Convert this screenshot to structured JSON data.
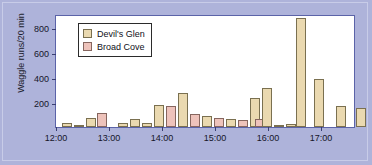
{
  "chart_data": {
    "type": "bar",
    "title": "",
    "xlabel": "",
    "ylabel": "Waggle runs/20 min",
    "ylim": [
      0,
      900
    ],
    "yticks": [
      200,
      400,
      600,
      800
    ],
    "xlim": [
      "12:00",
      "17:20"
    ],
    "xticks": [
      "12:00",
      "13:00",
      "14:00",
      "15:00",
      "16:00",
      "17:00"
    ],
    "grid": false,
    "legend_position": "top-left",
    "bar_width_minutes": 20,
    "series": [
      {
        "name": "Devil's Glen",
        "color": "#ead9b0",
        "points": [
          {
            "time": "12:20",
            "value": 30
          },
          {
            "time": "12:40",
            "value": 15
          },
          {
            "time": "13:00",
            "value": 75
          },
          {
            "time": "13:40",
            "value": 35
          },
          {
            "time": "14:00",
            "value": 60
          },
          {
            "time": "14:20",
            "value": 30
          },
          {
            "time": "14:40",
            "value": 175
          },
          {
            "time": "15:20",
            "value": 270
          },
          {
            "time": "15:40",
            "value": 20
          },
          {
            "time": "16:00",
            "value": 300
          },
          {
            "time": "16:20",
            "value": 25
          },
          {
            "time": "16:40",
            "value": 870
          },
          {
            "time": "17:00",
            "value": 385
          },
          {
            "time": "17:40",
            "value": 165
          },
          {
            "time": "18:20",
            "value": 155
          }
        ]
      },
      {
        "name": "Broad Cove",
        "color": "#eec3bb",
        "points": [
          {
            "time": "13:20",
            "value": 110
          },
          {
            "time": "15:00",
            "value": 170
          },
          {
            "time": "16:10",
            "value": 60
          }
        ]
      }
    ],
    "bars": [
      {
        "series": "Devil's Glen",
        "x_px": 66,
        "value": 30
      },
      {
        "series": "Devil's Glen",
        "x_px": 78,
        "value": 15
      },
      {
        "series": "Devil's Glen",
        "x_px": 90,
        "value": 75
      },
      {
        "series": "Broad Cove",
        "x_px": 101,
        "value": 110
      },
      {
        "series": "Devil's Glen",
        "x_px": 122,
        "value": 35
      },
      {
        "series": "Devil's Glen",
        "x_px": 134,
        "value": 60
      },
      {
        "series": "Devil's Glen",
        "x_px": 146,
        "value": 30
      },
      {
        "series": "Devil's Glen",
        "x_px": 158,
        "value": 175
      },
      {
        "series": "Broad Cove",
        "x_px": 170,
        "value": 170
      },
      {
        "series": "Devil's Glen",
        "x_px": 182,
        "value": 270
      },
      {
        "series": "Broad Cove",
        "x_px": 194,
        "value": 100
      },
      {
        "series": "Devil's Glen",
        "x_px": 206,
        "value": 90
      },
      {
        "series": "Broad Cove",
        "x_px": 218,
        "value": 70
      },
      {
        "series": "Devil's Glen",
        "x_px": 230,
        "value": 60
      },
      {
        "series": "Broad Cove",
        "x_px": 242,
        "value": 55
      },
      {
        "series": "Devil's Glen",
        "x_px": 254,
        "value": 230
      },
      {
        "series": "Broad Cove",
        "x_px": 259,
        "value": 60
      },
      {
        "series": "Devil's Glen",
        "x_px": 266,
        "value": 310
      },
      {
        "series": "Devil's Glen",
        "x_px": 278,
        "value": 20
      },
      {
        "series": "Devil's Glen",
        "x_px": 290,
        "value": 25
      },
      {
        "series": "Devil's Glen",
        "x_px": 300,
        "value": 870
      },
      {
        "series": "Devil's Glen",
        "x_px": 318,
        "value": 385
      },
      {
        "series": "Devil's Glen",
        "x_px": 340,
        "value": 165
      },
      {
        "series": "Devil's Glen",
        "x_px": 360,
        "value": 155
      }
    ]
  },
  "axes": {
    "ylabel": "Waggle runs/20 min",
    "ytick_labels": [
      "800",
      "600",
      "400",
      "200"
    ],
    "xtick_labels": [
      "12:00",
      "13:00",
      "14:00",
      "15:00",
      "16:00",
      "17:00"
    ]
  },
  "legend": {
    "entries": [
      {
        "label": "Devil's Glen",
        "swatch": "dg",
        "color": "#ead9b0"
      },
      {
        "label": "Broad Cove",
        "swatch": "bc",
        "color": "#eec3bb"
      }
    ]
  },
  "colors": {
    "background": "#aeb3da",
    "plot_background": "#ffffff",
    "plot_border": "#5b63a8",
    "devils_glen": "#ead9b0",
    "broad_cove": "#eec3bb"
  }
}
